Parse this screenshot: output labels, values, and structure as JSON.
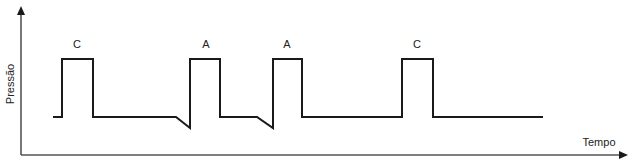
{
  "diagram": {
    "y_axis_label": "Pressão",
    "x_axis_label": "Tempo",
    "pulses": [
      {
        "label": "C",
        "label_x": 77,
        "rise_x": 62,
        "fall_x": 93
      },
      {
        "label": "A",
        "label_x": 206,
        "rise_x": 190,
        "fall_x": 220,
        "pre_dip_start_x": 176
      },
      {
        "label": "A",
        "label_x": 287,
        "rise_x": 273,
        "fall_x": 302,
        "pre_dip_start_x": 257
      },
      {
        "label": "C",
        "label_x": 417,
        "rise_x": 402,
        "fall_x": 433
      }
    ],
    "levels": {
      "baseline_y": 117,
      "high_y": 59,
      "dip_y": 128
    },
    "signal_start_x": 53,
    "signal_end_x": 543,
    "colors": {
      "signal": "#1a1a1a",
      "axis": "#555555",
      "background": "#ffffff"
    }
  }
}
